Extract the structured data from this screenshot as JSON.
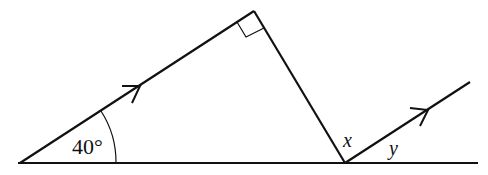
{
  "figure": {
    "angle_label": "40°",
    "x_label": "x",
    "y_label": "y",
    "right_angle_marker": true,
    "parallel_arrows": 2,
    "line_color": "#111111",
    "background": "#ffffff"
  }
}
